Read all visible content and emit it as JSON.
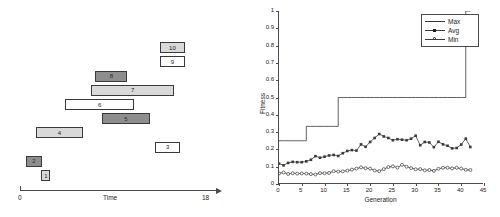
{
  "gantt": {
    "axis": {
      "label": "Time",
      "start_label": "0",
      "end_label": "18",
      "min": 0,
      "max": 18
    },
    "tasks": [
      {
        "id": "1",
        "label": "1",
        "start": 2.05,
        "end": 2.95,
        "row": 0,
        "fill": "light"
      },
      {
        "id": "2",
        "label": "2",
        "start": 0.55,
        "end": 2.15,
        "row": 1,
        "fill": "dark"
      },
      {
        "id": "3",
        "label": "3",
        "start": 13.1,
        "end": 15.5,
        "row": 2,
        "fill": "white"
      },
      {
        "id": "4",
        "label": "4",
        "start": 1.55,
        "end": 6.1,
        "row": 3,
        "fill": "light"
      },
      {
        "id": "5",
        "label": "5",
        "start": 7.9,
        "end": 12.6,
        "row": 4,
        "fill": "dark"
      },
      {
        "id": "6",
        "label": "6",
        "start": 4.4,
        "end": 11.0,
        "row": 5,
        "fill": "white"
      },
      {
        "id": "7",
        "label": "7",
        "start": 6.9,
        "end": 14.9,
        "row": 6,
        "fill": "light"
      },
      {
        "id": "8",
        "label": "8",
        "start": 7.3,
        "end": 10.4,
        "row": 7,
        "fill": "dark"
      },
      {
        "id": "9",
        "label": "9",
        "start": 13.5,
        "end": 16.0,
        "row": 8,
        "fill": "white"
      },
      {
        "id": "10",
        "label": "10",
        "start": 13.5,
        "end": 16.0,
        "row": 9,
        "fill": "light"
      }
    ]
  },
  "chart_data": {
    "type": "line",
    "title": "",
    "xlabel": "Generation",
    "ylabel": "Fitness",
    "xlim": [
      0,
      45
    ],
    "ylim": [
      0,
      1
    ],
    "xticks": [
      0,
      5,
      10,
      15,
      20,
      25,
      30,
      35,
      40,
      45
    ],
    "xtick_labels": [
      "0",
      "5",
      "10",
      "15",
      "20",
      "25",
      "30",
      "35",
      "40",
      "45"
    ],
    "yticks": [
      0,
      0.1,
      0.2,
      0.3,
      0.4,
      0.5,
      0.6,
      0.7,
      0.8,
      0.9,
      1
    ],
    "ytick_labels": [
      "0",
      "0.1",
      "0.2",
      "0.3",
      "0.4",
      "0.5",
      "0.6",
      "0.7",
      "0.8",
      "0.9",
      "1"
    ],
    "grid": false,
    "legend_position": "top-right",
    "legend": [
      "Max",
      "Avg",
      "Min"
    ],
    "x": [
      0,
      1,
      2,
      3,
      4,
      5,
      6,
      7,
      8,
      9,
      10,
      11,
      12,
      13,
      14,
      15,
      16,
      17,
      18,
      19,
      20,
      21,
      22,
      23,
      24,
      25,
      26,
      27,
      28,
      29,
      30,
      31,
      32,
      33,
      34,
      35,
      36,
      37,
      38,
      39,
      40,
      41,
      42
    ],
    "series": [
      {
        "name": "Max",
        "marker": "none",
        "values": [
          0.25,
          0.25,
          0.25,
          0.25,
          0.25,
          0.25,
          0.333,
          0.333,
          0.333,
          0.333,
          0.333,
          0.333,
          0.333,
          0.5,
          0.5,
          0.5,
          0.5,
          0.5,
          0.5,
          0.5,
          0.5,
          0.5,
          0.5,
          0.5,
          0.5,
          0.5,
          0.5,
          0.5,
          0.5,
          0.5,
          0.5,
          0.5,
          0.5,
          0.5,
          0.5,
          0.5,
          0.5,
          0.5,
          0.5,
          0.5,
          0.5,
          1.0,
          1.0
        ]
      },
      {
        "name": "Avg",
        "marker": "square",
        "values": [
          0.118,
          0.108,
          0.122,
          0.128,
          0.126,
          0.126,
          0.131,
          0.14,
          0.161,
          0.152,
          0.158,
          0.165,
          0.168,
          0.162,
          0.178,
          0.191,
          0.196,
          0.193,
          0.229,
          0.215,
          0.243,
          0.266,
          0.289,
          0.275,
          0.266,
          0.253,
          0.259,
          0.256,
          0.253,
          0.262,
          0.279,
          0.224,
          0.243,
          0.24,
          0.213,
          0.244,
          0.229,
          0.221,
          0.206,
          0.208,
          0.228,
          0.262,
          0.214
        ]
      },
      {
        "name": "Min",
        "marker": "circle",
        "values": [
          0.061,
          0.067,
          0.058,
          0.062,
          0.06,
          0.061,
          0.06,
          0.057,
          0.055,
          0.063,
          0.062,
          0.064,
          0.074,
          0.072,
          0.073,
          0.077,
          0.083,
          0.089,
          0.096,
          0.091,
          0.089,
          0.078,
          0.074,
          0.086,
          0.098,
          0.102,
          0.095,
          0.111,
          0.1,
          0.092,
          0.085,
          0.086,
          0.079,
          0.081,
          0.076,
          0.088,
          0.094,
          0.094,
          0.09,
          0.094,
          0.089,
          0.082,
          0.081
        ]
      }
    ]
  },
  "colors": {
    "line": "#3a3a3a",
    "axis": "#4a4a4a",
    "bar_dark": "#8e8e8e",
    "bar_light": "#d9d9d9",
    "bar_white": "#ffffff",
    "text": "#1a1a1a"
  }
}
